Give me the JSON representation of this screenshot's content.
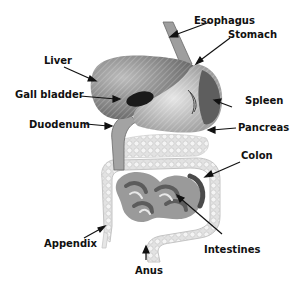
{
  "diagram": {
    "colors": {
      "organ_dark": "#3a3a3a",
      "organ_mid": "#8a8a8a",
      "organ_light": "#d6d6d6",
      "label": "#111111"
    },
    "labels": [
      {
        "id": "esophagus",
        "text": "Esophagus"
      },
      {
        "id": "stomach",
        "text": "Stomach"
      },
      {
        "id": "liver",
        "text": "Liver"
      },
      {
        "id": "gall-bladder",
        "text": "Gall bladder"
      },
      {
        "id": "spleen",
        "text": "Spleen"
      },
      {
        "id": "duodenum",
        "text": "Duodenum"
      },
      {
        "id": "pancreas",
        "text": "Pancreas"
      },
      {
        "id": "colon",
        "text": "Colon"
      },
      {
        "id": "appendix",
        "text": "Appendix"
      },
      {
        "id": "intestines",
        "text": "Intestines"
      },
      {
        "id": "anus",
        "text": "Anus"
      }
    ]
  }
}
